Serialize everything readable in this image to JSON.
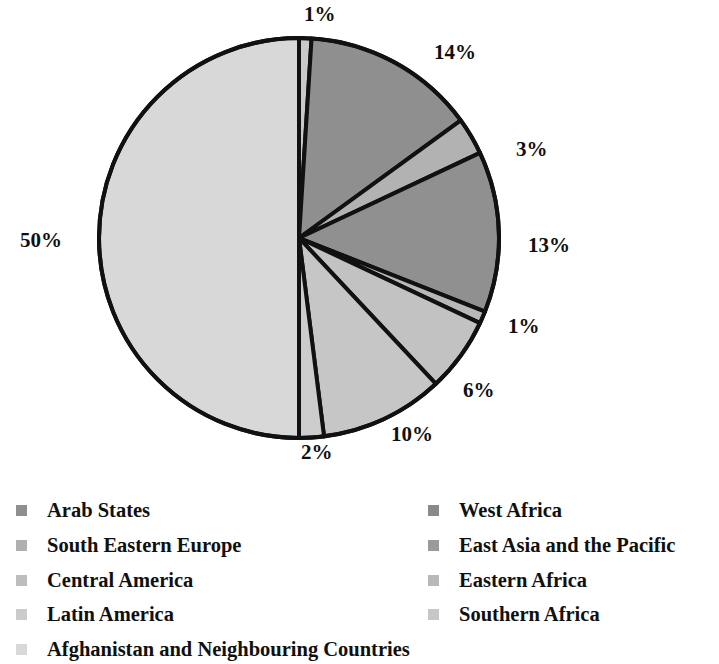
{
  "chart_data": {
    "type": "pie",
    "title": "",
    "labels": [
      "Arab States",
      "West Africa",
      "South Eastern Europe",
      "East Asia and the Pacific",
      "Central America",
      "Eastern Africa",
      "Latin America",
      "Southern Africa",
      "Afghanistan and Neighbouring Countries"
    ],
    "values": [
      1,
      14,
      3,
      13,
      1,
      6,
      10,
      2,
      50
    ],
    "value_labels": [
      "1%",
      "14%",
      "3%",
      "13%",
      "1%",
      "6%",
      "10%",
      "2%",
      "50%"
    ],
    "colors": [
      "#c9c9c9",
      "#8f8f8f",
      "#b2b2b2",
      "#909090",
      "#b8b8b8",
      "#c2c2c2",
      "#c6c6c6",
      "#cccccc",
      "#d8d8d8"
    ],
    "legend_position": "bottom",
    "grid": false,
    "slice_start_angle_deg": 0,
    "slice_direction": "clockwise",
    "unit": "%",
    "slices": [
      {
        "label": "Arab States",
        "value": 1,
        "value_label": "1%",
        "color": "#c9c9c9"
      },
      {
        "label": "West Africa",
        "value": 14,
        "value_label": "14%",
        "color": "#8f8f8f"
      },
      {
        "label": "South Eastern Europe",
        "value": 3,
        "value_label": "3%",
        "color": "#b2b2b2"
      },
      {
        "label": "East Asia and the Pacific",
        "value": 13,
        "value_label": "13%",
        "color": "#909090"
      },
      {
        "label": "Central America",
        "value": 1,
        "value_label": "1%",
        "color": "#b8b8b8"
      },
      {
        "label": "Eastern Africa",
        "value": 6,
        "value_label": "6%",
        "color": "#c2c2c2"
      },
      {
        "label": "Latin America",
        "value": 10,
        "value_label": "10%",
        "color": "#c6c6c6"
      },
      {
        "label": "Southern Africa",
        "value": 2,
        "value_label": "2%",
        "color": "#cccccc"
      },
      {
        "label": "Afghanistan and Neighbouring Countries",
        "value": 50,
        "value_label": "50%",
        "color": "#d8d8d8"
      }
    ]
  },
  "pie": {
    "center_x": 299,
    "center_y": 238,
    "radius": 200,
    "stroke_color": "#111111",
    "stroke_width": 4,
    "labels": [
      {
        "text": "1%",
        "x": 304,
        "y": 2
      },
      {
        "text": "14%",
        "x": 434,
        "y": 40
      },
      {
        "text": "3%",
        "x": 516,
        "y": 137
      },
      {
        "text": "13%",
        "x": 528,
        "y": 233
      },
      {
        "text": "1%",
        "x": 508,
        "y": 314
      },
      {
        "text": "6%",
        "x": 463,
        "y": 378
      },
      {
        "text": "10%",
        "x": 391,
        "y": 422
      },
      {
        "text": "2%",
        "x": 301,
        "y": 440
      },
      {
        "text": "50%",
        "x": 20,
        "y": 228
      }
    ]
  },
  "legend": {
    "columns": [
      {
        "x": 16,
        "label_x": 47,
        "items": [
          {
            "label": "Arab States",
            "color": "#8f8f8f",
            "y": 8
          },
          {
            "label": "South Eastern Europe",
            "color": "#b0b0b0",
            "y": 43
          },
          {
            "label": "Central America",
            "color": "#bdbdbd",
            "y": 78
          },
          {
            "label": "Latin America",
            "color": "#cbcbcb",
            "y": 112
          },
          {
            "label": "Afghanistan and Neighbouring Countries",
            "color": "#d8d8d8",
            "y": 147
          }
        ]
      },
      {
        "x": 428,
        "label_x": 459,
        "items": [
          {
            "label": "West Africa",
            "color": "#8a8a8a",
            "y": 8
          },
          {
            "label": "East Asia and the Pacific",
            "color": "#9a9a9a",
            "y": 43
          },
          {
            "label": "Eastern Africa",
            "color": "#b8b8b8",
            "y": 78
          },
          {
            "label": "Southern Africa",
            "color": "#c7c7c7",
            "y": 112
          }
        ]
      }
    ]
  }
}
